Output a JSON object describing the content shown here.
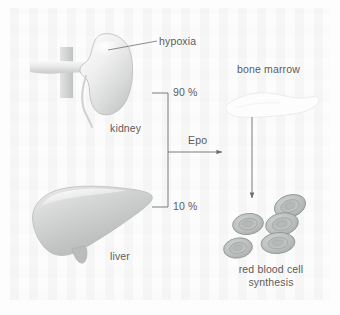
{
  "figure": {
    "text_color": "#5c5c5c",
    "background_color": "#fcfcfc",
    "line_color": "#6e6e6e"
  },
  "labels": {
    "hypoxia": "hypoxia",
    "kidney": "kidney",
    "liver": "liver",
    "percent_kidney": "90 %",
    "percent_liver": "10 %",
    "epo": "Epo",
    "bone_marrow": "bone marrow",
    "rbc_line1": "red blood cell",
    "rbc_line2": "synthesis"
  },
  "organs": [
    {
      "name": "kidney",
      "label": "kidney",
      "epo_share": "90 %"
    },
    {
      "name": "liver",
      "label": "liver",
      "epo_share": "10 %"
    }
  ],
  "flow": {
    "source_bracket": [
      "90 %",
      "10 %"
    ],
    "signal": "Epo",
    "target": "bone marrow",
    "outcome": "red blood cell synthesis",
    "stimulus": "hypoxia"
  },
  "red_blood_cells": {
    "count": 5,
    "fill_color": "#b9bdba",
    "outline_color": "#8d918f"
  },
  "icons": {
    "kidney": "kidney-icon",
    "liver": "liver-icon",
    "bone": "bone-icon",
    "cells": "red-blood-cell-icon",
    "arrow_epo": "arrow-right-icon",
    "arrow_marrow": "arrow-down-icon",
    "leader": "leader-line-icon",
    "bracket": "bracket-icon"
  }
}
